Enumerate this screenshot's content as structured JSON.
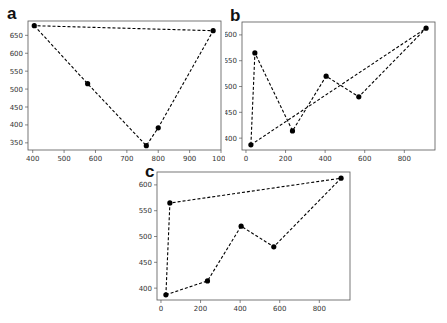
{
  "figure": {
    "panels": [
      {
        "label": "a"
      },
      {
        "label": "b"
      },
      {
        "label": "c"
      }
    ]
  },
  "chart_data": [
    {
      "panel": "a",
      "type": "line",
      "title": "",
      "xlabel": "",
      "ylabel": "",
      "line_style": "dashed",
      "marker": "circle",
      "color": "#000000",
      "xlim": [
        385,
        1000
      ],
      "ylim": [
        330,
        690
      ],
      "xticks": [
        400,
        500,
        600,
        700,
        800,
        900,
        1000
      ],
      "xtick_labels": [
        "400",
        "500",
        "600",
        "700",
        "800",
        "900",
        "1000"
      ],
      "yticks": [
        350,
        400,
        450,
        500,
        550,
        600,
        650
      ],
      "ytick_labels": [
        "350",
        "400",
        "450",
        "500",
        "550",
        "600",
        "650"
      ],
      "grid": false,
      "path_closed": true,
      "points": [
        {
          "x": 405,
          "y": 677
        },
        {
          "x": 575,
          "y": 515
        },
        {
          "x": 762,
          "y": 342
        },
        {
          "x": 800,
          "y": 392
        },
        {
          "x": 975,
          "y": 663
        }
      ]
    },
    {
      "panel": "b",
      "type": "line",
      "title": "",
      "xlabel": "",
      "ylabel": "",
      "line_style": "dashed",
      "marker": "circle",
      "color": "#000000",
      "xlim": [
        -20,
        955
      ],
      "ylim": [
        377,
        625
      ],
      "xticks": [
        0,
        200,
        400,
        600,
        800
      ],
      "xtick_labels": [
        "0",
        "200",
        "400",
        "600",
        "800"
      ],
      "yticks": [
        400,
        450,
        500,
        550,
        600
      ],
      "ytick_labels": [
        "400",
        "450",
        "500",
        "550",
        "600"
      ],
      "grid": false,
      "path_closed": true,
      "points": [
        {
          "x": 25,
          "y": 387
        },
        {
          "x": 45,
          "y": 565
        },
        {
          "x": 235,
          "y": 414
        },
        {
          "x": 405,
          "y": 520
        },
        {
          "x": 570,
          "y": 480
        },
        {
          "x": 910,
          "y": 613
        }
      ]
    },
    {
      "panel": "c",
      "type": "line",
      "title": "",
      "xlabel": "",
      "ylabel": "",
      "line_style": "dashed",
      "marker": "circle",
      "color": "#000000",
      "xlim": [
        -20,
        955
      ],
      "ylim": [
        377,
        625
      ],
      "xticks": [
        0,
        200,
        400,
        600,
        800
      ],
      "xtick_labels": [
        "0",
        "200",
        "400",
        "600",
        "800"
      ],
      "yticks": [
        400,
        450,
        500,
        550,
        600
      ],
      "ytick_labels": [
        "400",
        "450",
        "500",
        "550",
        "600"
      ],
      "grid": false,
      "path_closed": true,
      "points": [
        {
          "x": 25,
          "y": 387
        },
        {
          "x": 235,
          "y": 414
        },
        {
          "x": 405,
          "y": 520
        },
        {
          "x": 570,
          "y": 480
        },
        {
          "x": 910,
          "y": 613
        },
        {
          "x": 45,
          "y": 565
        }
      ]
    }
  ]
}
